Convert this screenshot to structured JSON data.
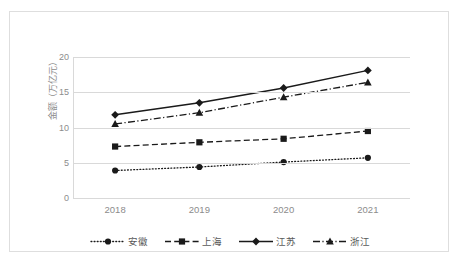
{
  "chart_data": {
    "type": "line",
    "title": "",
    "xlabel": "",
    "ylabel": "金额（万亿元）",
    "categories": [
      "2018",
      "2019",
      "2020",
      "2021"
    ],
    "ylim": [
      0,
      20
    ],
    "yticks": [
      0,
      5,
      10,
      15,
      20
    ],
    "grid": "horizontal",
    "legend_position": "bottom",
    "series": [
      {
        "name": "安徽",
        "marker": "circle",
        "linestyle": "dotted",
        "color": "#1a1a1a",
        "values": [
          3.9,
          4.4,
          5.1,
          5.7
        ]
      },
      {
        "name": "上海",
        "marker": "square",
        "linestyle": "dashed",
        "color": "#1a1a1a",
        "values": [
          7.3,
          7.9,
          8.4,
          9.5
        ]
      },
      {
        "name": "江苏",
        "marker": "diamond",
        "linestyle": "solid",
        "color": "#1a1a1a",
        "values": [
          11.8,
          13.5,
          15.6,
          18.1
        ]
      },
      {
        "name": "浙江",
        "marker": "triangle",
        "linestyle": "dashdot",
        "color": "#1a1a1a",
        "values": [
          10.5,
          12.1,
          14.3,
          16.4
        ]
      }
    ]
  },
  "axis": {
    "y_tick_labels": [
      "20",
      "15",
      "10",
      "5",
      "0"
    ],
    "x_tick_labels": [
      "2018",
      "2019",
      "2020",
      "2021"
    ],
    "y_title": "金额（万亿元）"
  },
  "legend": {
    "entries": [
      {
        "label": "安徽",
        "icon": "dotted-line-circle-marker-icon"
      },
      {
        "label": "上海",
        "icon": "dashed-line-square-marker-icon"
      },
      {
        "label": "江苏",
        "icon": "solid-line-diamond-marker-icon"
      },
      {
        "label": "浙江",
        "icon": "dashdot-line-triangle-marker-icon"
      }
    ]
  },
  "colors": {
    "grid": "#d9d9d9",
    "text": "#8c8c8c",
    "series": "#1a1a1a",
    "border": "#dedede",
    "background": "#ffffff"
  }
}
